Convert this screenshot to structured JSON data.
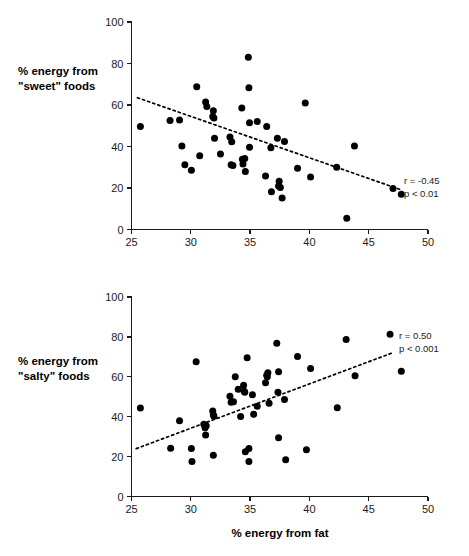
{
  "figure": {
    "background": "#ffffff",
    "point_color": "#000000",
    "axis_color": "#1a1a1a"
  },
  "xlabel": "% energy from fat",
  "chart_data": [
    {
      "type": "scatter",
      "panel": "top",
      "title": "",
      "ylabel_line1": "% energy from",
      "ylabel_line2": "\"sweet\" foods",
      "xlabel": "",
      "xlim": [
        25,
        50
      ],
      "ylim": [
        0,
        100
      ],
      "xticks": [
        25,
        30,
        35,
        40,
        45,
        50
      ],
      "yticks": [
        0,
        20,
        40,
        60,
        80,
        100
      ],
      "grid": false,
      "annotations": [
        "r = -0.45",
        "p < 0.01"
      ],
      "r": -0.45,
      "p": "< 0.01",
      "trendline": {
        "x0": 25.5,
        "y0": 63.5,
        "x1": 47.8,
        "y1": 19.0,
        "style": "dotted"
      },
      "points": [
        [
          25.75,
          49.6
        ],
        [
          28.25,
          52.5
        ],
        [
          29.05,
          52.8
        ],
        [
          29.25,
          40.3
        ],
        [
          29.5,
          31.2
        ],
        [
          30.05,
          28.6
        ],
        [
          30.5,
          68.8
        ],
        [
          30.75,
          35.6
        ],
        [
          31.25,
          61.5
        ],
        [
          31.35,
          59.3
        ],
        [
          31.9,
          57.2
        ],
        [
          31.85,
          54.5
        ],
        [
          31.95,
          53.7
        ],
        [
          32.0,
          44.0
        ],
        [
          32.5,
          36.4
        ],
        [
          33.3,
          44.6
        ],
        [
          33.45,
          42.3
        ],
        [
          33.4,
          31.2
        ],
        [
          33.55,
          30.8
        ],
        [
          34.3,
          58.5
        ],
        [
          34.35,
          33.8
        ],
        [
          34.4,
          31.6
        ],
        [
          34.55,
          34.2
        ],
        [
          34.6,
          28.0
        ],
        [
          34.85,
          83.0
        ],
        [
          34.9,
          68.3
        ],
        [
          34.95,
          51.5
        ],
        [
          34.95,
          39.6
        ],
        [
          35.6,
          52.0
        ],
        [
          36.4,
          49.6
        ],
        [
          36.3,
          25.8
        ],
        [
          36.75,
          39.4
        ],
        [
          36.8,
          18.2
        ],
        [
          37.3,
          44.0
        ],
        [
          37.45,
          23.2
        ],
        [
          37.4,
          21.0
        ],
        [
          37.55,
          20.2
        ],
        [
          37.7,
          15.2
        ],
        [
          37.9,
          42.4
        ],
        [
          39.0,
          29.5
        ],
        [
          39.65,
          61.0
        ],
        [
          40.1,
          25.3
        ],
        [
          42.3,
          30.0
        ],
        [
          43.15,
          5.4
        ],
        [
          43.8,
          40.3
        ],
        [
          47.05,
          19.8
        ],
        [
          47.75,
          17.0
        ]
      ]
    },
    {
      "type": "scatter",
      "panel": "bottom",
      "title": "",
      "ylabel_line1": "% energy from",
      "ylabel_line2": "\"salty\" foods",
      "xlabel": "% energy from fat",
      "xlim": [
        25,
        50
      ],
      "ylim": [
        0,
        100
      ],
      "xticks": [
        25,
        30,
        35,
        40,
        45,
        50
      ],
      "yticks": [
        0,
        20,
        40,
        60,
        80,
        100
      ],
      "grid": false,
      "annotations": [
        "r = 0.50",
        "p < 0.001"
      ],
      "r": 0.5,
      "p": "< 0.001",
      "trendline": {
        "x0": 25.4,
        "y0": 24.0,
        "x1": 47.0,
        "y1": 72.0,
        "style": "dotted"
      },
      "points": [
        [
          25.75,
          44.3
        ],
        [
          28.3,
          24.2
        ],
        [
          29.05,
          38.0
        ],
        [
          30.05,
          24.0
        ],
        [
          30.1,
          17.6
        ],
        [
          30.45,
          67.5
        ],
        [
          31.1,
          36.2
        ],
        [
          31.2,
          34.5
        ],
        [
          31.25,
          30.8
        ],
        [
          31.3,
          35.5
        ],
        [
          31.85,
          42.8
        ],
        [
          31.9,
          41.0
        ],
        [
          31.95,
          40.2
        ],
        [
          31.9,
          20.7
        ],
        [
          33.3,
          50.2
        ],
        [
          33.4,
          47.3
        ],
        [
          33.6,
          47.5
        ],
        [
          33.75,
          60.0
        ],
        [
          34.0,
          53.7
        ],
        [
          34.2,
          40.1
        ],
        [
          34.45,
          55.8
        ],
        [
          34.5,
          52.8
        ],
        [
          34.55,
          52.2
        ],
        [
          34.6,
          22.4
        ],
        [
          34.75,
          69.5
        ],
        [
          34.9,
          24.0
        ],
        [
          34.9,
          17.5
        ],
        [
          35.2,
          51.0
        ],
        [
          35.3,
          41.2
        ],
        [
          35.6,
          45.2
        ],
        [
          36.3,
          57.0
        ],
        [
          36.4,
          60.8
        ],
        [
          36.45,
          60.0
        ],
        [
          36.5,
          62.0
        ],
        [
          36.6,
          46.8
        ],
        [
          37.25,
          76.8
        ],
        [
          37.35,
          52.3
        ],
        [
          37.4,
          62.5
        ],
        [
          37.4,
          29.4
        ],
        [
          37.9,
          48.6
        ],
        [
          38.0,
          18.4
        ],
        [
          39.0,
          70.2
        ],
        [
          39.75,
          23.4
        ],
        [
          40.1,
          64.2
        ],
        [
          42.35,
          44.5
        ],
        [
          43.1,
          78.7
        ],
        [
          43.85,
          60.5
        ],
        [
          46.8,
          81.3
        ],
        [
          47.75,
          62.8
        ]
      ]
    }
  ]
}
